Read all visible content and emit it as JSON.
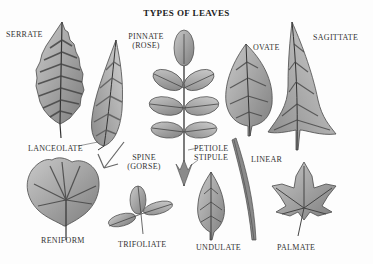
{
  "title": "TYPES OF LEAVES",
  "labels": {
    "serrate": "SERRATE",
    "lanceolate": "LANCEOLATE",
    "pinnate_1": "PINNATE",
    "pinnate_2": "(ROSE)",
    "ovate": "OVATE",
    "sagittate": "SAGITTATE",
    "spine_1": "SPINE",
    "spine_2": "(GORSE)",
    "petiole": "PETIOLE",
    "stipule": "STIPULE",
    "linear": "LINEAR",
    "reniform": "RENIFORM",
    "trifoliate": "TRIFOLIATE",
    "undulate": "UNDULATE",
    "palmate": "PALMATE"
  },
  "colors": {
    "leaf_fill": "#9a9a9a",
    "leaf_light": "#c4c4c4",
    "vein": "#3a3a3a",
    "outline": "#4a4a4a",
    "text": "#333333"
  }
}
